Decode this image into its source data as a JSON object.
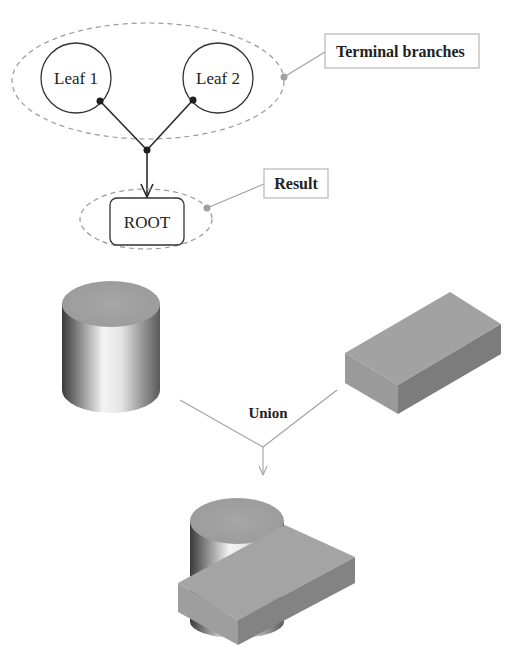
{
  "tree": {
    "leaves": [
      {
        "label": "Leaf 1"
      },
      {
        "label": "Leaf 2"
      }
    ],
    "root": {
      "label": "ROOT"
    },
    "callouts": {
      "terminal_branches": "Terminal branches",
      "result": "Result"
    }
  },
  "operation": {
    "label": "Union",
    "operands": [
      "cylinder",
      "box"
    ],
    "result": "cylinder-union-box"
  },
  "colors": {
    "line_dark": "#2a2a2a",
    "dashed_gray": "#9a9a9a",
    "callout_gray": "#a0a0a0",
    "solid_face_gray": "#9c9c9c",
    "solid_side_dark": "#7a7a7a"
  }
}
